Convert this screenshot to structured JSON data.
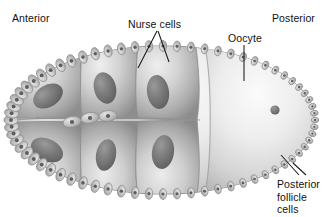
{
  "figure": {
    "background_color": "#ffffff",
    "width": 331,
    "height": 217
  },
  "labels": {
    "anterior": "Anterior",
    "posterior": "Posterior",
    "nurse_cells": "Nurse cells",
    "oocyte": "Oocyte",
    "posterior_follicle_cells": {
      "line1": "Posterior",
      "line2": "follicle",
      "line3": "cells"
    }
  },
  "colors": {
    "text": "#111111",
    "leader_line": "#1a1a1a",
    "cell_light": "#e8e8e8",
    "cell_mid": "#b9b9b9",
    "cell_dark": "#8a8a8a",
    "nucleus": "#6a6a6a",
    "outline": "#7d7d7d",
    "oocyte_light": "#f2f2f2"
  },
  "diagram": {
    "chamber": {
      "center_x": 163,
      "center_y": 120,
      "radius_x": 152,
      "radius_y": 74
    },
    "nurse_cells": [
      {
        "id": "nc-1",
        "nucleus_cx": 48,
        "nucleus_cy": 96,
        "nucleus_rx": 16,
        "nucleus_ry": 11,
        "angle": -32
      },
      {
        "id": "nc-2",
        "nucleus_cx": 105,
        "nucleus_cy": 88,
        "nucleus_rx": 11,
        "nucleus_ry": 16,
        "angle": -14
      },
      {
        "id": "nc-3",
        "nucleus_cx": 158,
        "nucleus_cy": 92,
        "nucleus_rx": 11,
        "nucleus_ry": 17,
        "angle": -8
      },
      {
        "id": "nc-4",
        "nucleus_cx": 47,
        "nucleus_cy": 150,
        "nucleus_rx": 17,
        "nucleus_ry": 11,
        "angle": 26
      },
      {
        "id": "nc-5",
        "nucleus_cx": 106,
        "nucleus_cy": 155,
        "nucleus_rx": 10,
        "nucleus_ry": 16,
        "angle": 10
      },
      {
        "id": "nc-6",
        "nucleus_cx": 163,
        "nucleus_cy": 152,
        "nucleus_rx": 11,
        "nucleus_ry": 17,
        "angle": 8
      }
    ],
    "oocyte": {
      "nucleus_cx": 275,
      "nucleus_cy": 110,
      "nucleus_r": 4.5,
      "boundary_x": 203
    },
    "follicle_cell_count": 68
  },
  "leaders": {
    "nurse_left": {
      "x1": 157,
      "y1": 31,
      "x2": 138,
      "y2": 68
    },
    "nurse_right": {
      "x1": 158,
      "y1": 31,
      "x2": 169,
      "y2": 62
    },
    "oocyte": {
      "x1": 244,
      "y1": 45,
      "x2": 244,
      "y2": 81
    },
    "pfc": {
      "x1": 299,
      "y1": 175,
      "x2": 281,
      "y2": 155
    },
    "pfc2": {
      "x1": 305,
      "y1": 175,
      "x2": 292,
      "y2": 163
    }
  }
}
